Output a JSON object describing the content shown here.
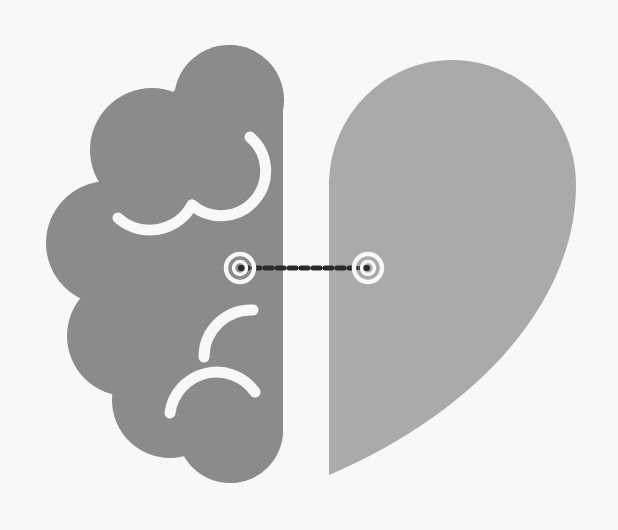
{
  "illustration": {
    "title": "Brain and heart connected",
    "description": "Split icon: left half is a brain, right half is a heart, joined by a dashed connection line between two target markers",
    "colors": {
      "background": "#f8f8f8",
      "brain": "#8b8b8b",
      "heart": "#aaaaaa",
      "accent_lines": "#f8f8f8",
      "connector": "#2b2b2b"
    },
    "elements": [
      {
        "name": "brain-half",
        "icon": "brain-icon"
      },
      {
        "name": "heart-half",
        "icon": "heart-icon"
      },
      {
        "name": "left-target",
        "icon": "target-icon"
      },
      {
        "name": "right-target",
        "icon": "target-icon"
      },
      {
        "name": "dashed-connector",
        "icon": "dashed-line"
      }
    ]
  }
}
